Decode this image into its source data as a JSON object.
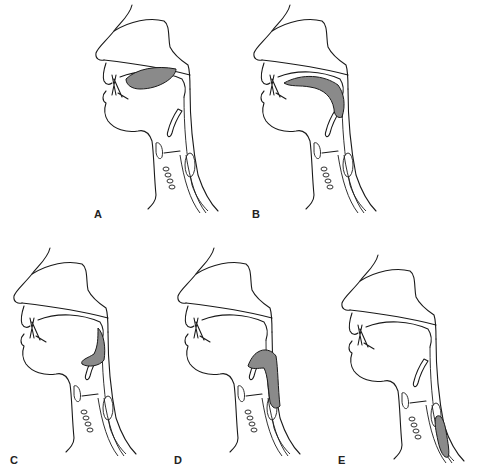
{
  "figure": {
    "bolus_color": "#8a8a8a",
    "line_color": "#1a1a1a",
    "background": "#ffffff",
    "panels": [
      {
        "id": "A",
        "label": "A",
        "bolus_location": "oral-cavity"
      },
      {
        "id": "B",
        "label": "B",
        "bolus_location": "oropharynx"
      },
      {
        "id": "C",
        "label": "C",
        "bolus_location": "pharynx"
      },
      {
        "id": "D",
        "label": "D",
        "bolus_location": "hypopharynx"
      },
      {
        "id": "E",
        "label": "E",
        "bolus_location": "esophagus"
      }
    ]
  }
}
